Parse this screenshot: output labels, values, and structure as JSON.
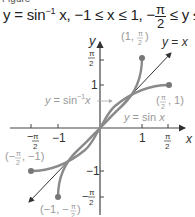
{
  "figure": {
    "caption_partial": "Figure",
    "title": {
      "lhs": "y = sin",
      "sup": "−1",
      "rest": " x, −1 ≤ x ≤ 1, −",
      "frac_num": "π",
      "frac_den": "2",
      "mid": " ≤ y ≤ ",
      "frac2_num": "π",
      "frac2_den": "2"
    }
  },
  "graph": {
    "axis_labels": {
      "x": "x",
      "y": "y"
    },
    "x_ticks": [
      {
        "label": "−π/2",
        "value": -1.5708
      },
      {
        "label": "−1",
        "value": -1
      },
      {
        "label": "1",
        "value": 1
      },
      {
        "label": "π/2",
        "value": 1.5708
      }
    ],
    "y_ticks": [
      {
        "label": "π/2",
        "value": 1.5708
      },
      {
        "label": "1",
        "value": 1
      },
      {
        "label": "−1",
        "value": -1
      },
      {
        "label": "−π/2",
        "value": -1.5708
      }
    ],
    "curves": [
      {
        "name": "y = sin⁻¹ x",
        "label": "y = sin⁻¹x",
        "color": "#8a8a8a"
      },
      {
        "name": "y = sin x",
        "label": "y = sin x",
        "color": "#8a8a8a"
      },
      {
        "name": "y = x",
        "label": "y = x",
        "color": "#333333"
      }
    ],
    "points": [
      {
        "label": "(1, π/2)",
        "x": 1,
        "y": 1.5708
      },
      {
        "label": "(π/2, 1)",
        "x": 1.5708,
        "y": 1
      },
      {
        "label": "(−π/2, −1)",
        "x": -1.5708,
        "y": -1
      },
      {
        "label": "(−1, −π/2)",
        "x": -1,
        "y": -1.5708
      }
    ],
    "colors": {
      "axis": "#444444",
      "curve": "#8a8a8a",
      "identity_line": "#333333",
      "label_gray": "#999999"
    }
  }
}
